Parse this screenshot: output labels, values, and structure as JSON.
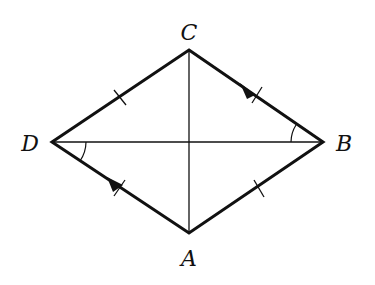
{
  "figure": {
    "type": "rhombus-with-diagonals",
    "stroke_color": "#111111",
    "background": "#ffffff",
    "vertices": {
      "C": {
        "x": 189,
        "y": 50,
        "label": "C",
        "label_x": 189,
        "label_y": 40
      },
      "B": {
        "x": 323,
        "y": 142,
        "label": "B",
        "label_x": 344,
        "label_y": 151
      },
      "A": {
        "x": 189,
        "y": 233,
        "label": "A",
        "label_x": 189,
        "label_y": 266
      },
      "D": {
        "x": 52,
        "y": 142,
        "label": "D",
        "label_x": 30,
        "label_y": 151
      }
    },
    "sides": [
      "DC",
      "CB",
      "BA",
      "AD"
    ],
    "diagonals": [
      "CA",
      "DB"
    ],
    "tick_marks": [
      "DC",
      "CB",
      "BA",
      "AD"
    ],
    "parallel_arrows": [
      "CB",
      "DA"
    ],
    "angle_marks": [
      {
        "vertex": "D",
        "between": [
          "DB",
          "DA"
        ]
      },
      {
        "vertex": "B",
        "between": [
          "BD",
          "BC"
        ]
      }
    ]
  }
}
